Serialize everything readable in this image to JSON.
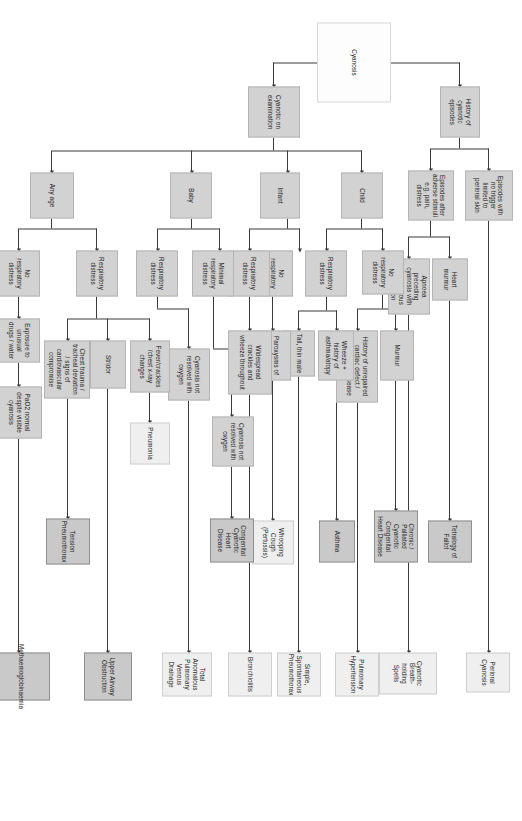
{
  "diagram": {
    "orientation": "rotated-90",
    "colors": {
      "root_fill": "#fdfdfd",
      "step_fill": "#d2d2d2",
      "outcome_fill": "#c9c9c9",
      "outcome_light_fill": "#efefef",
      "line": "#3a3a3a",
      "text": "#1b1b1b"
    },
    "nodes": {
      "root": "Cyanosis",
      "history_of_cyanotic_episodes": "History of cyanotic episodes",
      "cyanotic_on_examination": "Cyanotic on examination",
      "episodes_no_trigger": "Episodes with no trigger limited to perioral skin",
      "episodes_after_adverse": "Episodes after adverse stimuli e.g. pain, distress",
      "heart_murmur": "Heart murmur",
      "apnoea_preceding": "Apnoea preceding cyanosis with spontaneous resolution",
      "perioral_cyanosis": "Perioral Cyanosis",
      "tetralogy_of_fallot": "Tetralogy of Fallot",
      "cyanotic_breath_holding": "Cyanotic Breath-holding Spells",
      "child": "Child",
      "child_no_resp": "No respiratory distress",
      "child_resp": "Respiratory distress",
      "murmur": "Murmur",
      "history_unrepaired": "History of unrepaired cardiac defect / chronic lung disease",
      "wheeze_atopy": "Wheeze + history of asthma/atopy",
      "tall_thin_male": "Tall, thin male",
      "chronic_palliated": "Chronic / Palliated Cyanotic Congenital Heart Disease",
      "pulmonary_hypertension": "Pulmonary Hypertension",
      "asthma": "Asthma",
      "simple_pneumothorax": "Simple, Spontaneous Pneumothorax",
      "infant": "Infant",
      "infant_no_resp": "No respiratory distress",
      "infant_resp": "Respiratory distress",
      "paroxysms_coughing": "Paroxysms of coughing",
      "whooping_cough": "Whooping Cough (Pertussis)",
      "widespread_crackles": "Widespread crackles and wheeze throughout",
      "bronchiolitis": "Bronchiolitis",
      "baby": "Baby",
      "baby_minimal_resp": "Minimal respiratory distress",
      "baby_resp": "Respiratory distress",
      "cyanosis_not_resolved_1": "Cyanosis not resolved with oxygen",
      "cyanosis_not_resolved_2": "Cyanosis not resolved with oxygen",
      "congenital_cyanotic_hd": "Congenital Cyanotic Heart Disease",
      "tapvd": "Total Anomalous Pulmonary Venous Drainage",
      "any_age": "Any age",
      "anyage_resp": "Respiratory distress",
      "anyage_no_resp": "No respiratory distress",
      "fever_crackles": "Fever/crackles /chest x-ray changes",
      "pneumonia": "Pneumonia",
      "stridor": "Stridor",
      "upper_airway_obstruction": "Upper Airway Obstruction",
      "chest_trauma": "Chest trauma / tracheal deviation / signs of cardiovascular compromise",
      "tension_pneumothorax": "Tension Pneumothorax",
      "exposure_unusual": "Exposure to unusual drugs / water",
      "pao2_normal": "PaO2 normal despite visible cyanosis",
      "methaemoglobinaemia": "Methaemoglobinaemia"
    }
  }
}
